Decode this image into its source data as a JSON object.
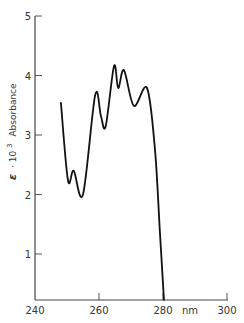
{
  "chart_data": {
    "type": "line",
    "title": "",
    "xlabel": "nm",
    "ylabel": "ε · 10³  Absorbance",
    "xlim": [
      240,
      300
    ],
    "ylim": [
      0.3,
      5
    ],
    "x_ticks": [
      240,
      260,
      280,
      300
    ],
    "y_ticks": [
      1,
      2,
      3,
      4,
      5
    ],
    "grid": false,
    "legend": null,
    "series": [
      {
        "name": "absorbance",
        "x": [
          248.1,
          250.3,
          252.1,
          255.0,
          258.8,
          260.6,
          262.1,
          264.7,
          266.0,
          267.8,
          270.9,
          275.0,
          277.5,
          279.0,
          280.3
        ],
        "y": [
          3.54,
          2.24,
          2.4,
          2.0,
          3.67,
          3.32,
          3.15,
          4.16,
          3.79,
          4.09,
          3.49,
          3.79,
          2.75,
          1.4,
          0.23
        ]
      }
    ]
  },
  "axes": {
    "x_unit": "nm",
    "y_label_prefix": "ε",
    "y_label_mid": "· 10",
    "y_label_exp": "3",
    "y_label_suffix": "Absorbance",
    "x_tick_labels": [
      "240",
      "260",
      "280",
      "300"
    ],
    "y_tick_labels": [
      "1",
      "2",
      "3",
      "4",
      "5"
    ]
  }
}
